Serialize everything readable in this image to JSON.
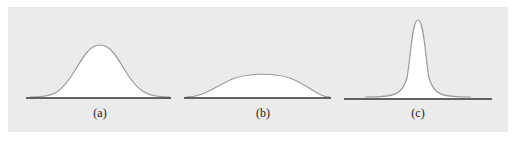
{
  "figure": {
    "background_color": "#ebebeb",
    "curve_color": "#9a9a9a",
    "axis_color": "#333333",
    "fill_color": "#ffffff",
    "panels": [
      {
        "label": "(a)",
        "shape": "medium-width bell curve, moderate height"
      },
      {
        "label": "(b)",
        "shape": "wide flat bell curve, low height"
      },
      {
        "label": "(c)",
        "shape": "narrow tall peak"
      }
    ]
  }
}
